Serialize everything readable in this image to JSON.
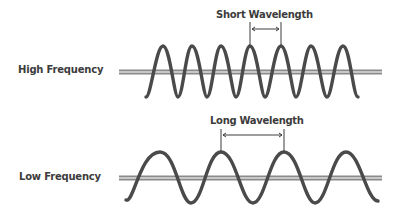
{
  "diagram": {
    "rows": [
      {
        "label": "High Frequency",
        "wavelength_label": "Short Wavelength",
        "period_px": 30,
        "axis_y": 72,
        "amplitude_px": 26
      },
      {
        "label": "Low Frequency",
        "wavelength_label": "Long Wavelength",
        "period_px": 62,
        "axis_y": 178,
        "amplitude_px": 25
      }
    ],
    "colors": {
      "wave": "#4a4a4a",
      "axis_outer": "#8a8a8a",
      "axis_inner": "#d8d8d8",
      "text": "#3c3c3c"
    }
  }
}
